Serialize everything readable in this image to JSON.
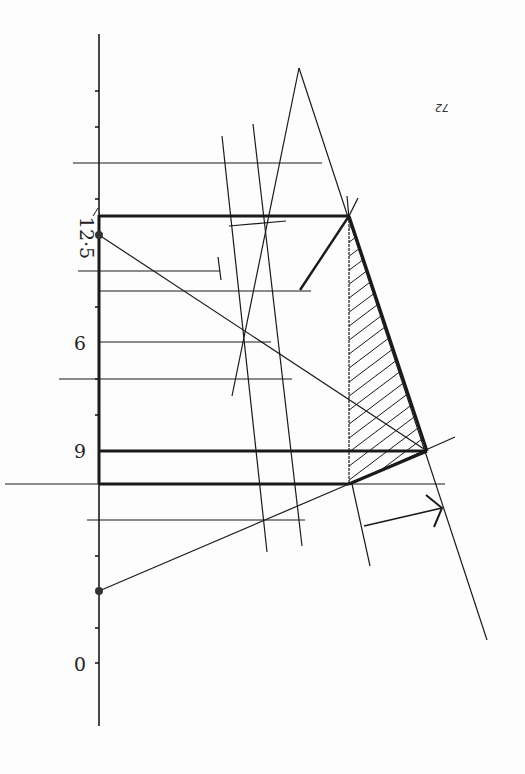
{
  "page": {
    "number_label": "72",
    "orientation": "rotated 180 degrees (upside-down scan)"
  },
  "axis": {
    "labels": [
      {
        "text": "12·5",
        "value": 12.5
      },
      {
        "text": "9",
        "value": 9
      },
      {
        "text": "6",
        "value": 6
      },
      {
        "text": "0",
        "value": 0
      }
    ]
  },
  "colors": {
    "ink": "#1a1a1a",
    "paper": "#fdfdfd"
  }
}
